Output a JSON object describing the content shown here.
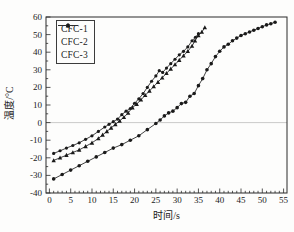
{
  "figure": {
    "background": "#fdfdfc",
    "frame_color": "#2b2b2b",
    "text_color": "#1a1a1a",
    "zero_line_color": "#bdbdbd"
  },
  "chart_data": {
    "type": "line",
    "title": "",
    "xlabel": "时间/s",
    "ylabel": "温度/°C",
    "xlim": [
      0,
      55
    ],
    "ylim": [
      -40,
      60
    ],
    "x_ticks": [
      0,
      5,
      10,
      15,
      20,
      25,
      30,
      35,
      40,
      45,
      50,
      55
    ],
    "y_ticks": [
      -40,
      -30,
      -20,
      -10,
      0,
      10,
      20,
      30,
      40,
      50,
      60
    ],
    "grid": "horizontal reference line at y=0 only",
    "legend_position": "top-left",
    "legend": [
      "CFC-1",
      "CFC-2",
      "CFC-3"
    ],
    "series": [
      {
        "name": "CFC-1",
        "marker": "filled-circle",
        "color": "#2e2e2e",
        "points": [
          [
            1,
            -32
          ],
          [
            3,
            -29.5
          ],
          [
            5,
            -27
          ],
          [
            7,
            -24.5
          ],
          [
            9,
            -22
          ],
          [
            11,
            -19.5
          ],
          [
            13,
            -17
          ],
          [
            15,
            -14.5
          ],
          [
            17,
            -12.5
          ],
          [
            19,
            -10
          ],
          [
            21,
            -7.5
          ],
          [
            23,
            -4
          ],
          [
            25,
            -0.5
          ],
          [
            26,
            1.5
          ],
          [
            27,
            3.8
          ],
          [
            28,
            5.5
          ],
          [
            29,
            6.5
          ],
          [
            30,
            8.5
          ],
          [
            31,
            10.8
          ],
          [
            32,
            11.5
          ],
          [
            33,
            15
          ],
          [
            34,
            16.5
          ],
          [
            35,
            21
          ],
          [
            36,
            25
          ],
          [
            37,
            30
          ],
          [
            38,
            33.5
          ],
          [
            39,
            37.5
          ],
          [
            40,
            40.5
          ],
          [
            41,
            43
          ],
          [
            42,
            44.5
          ],
          [
            43,
            46.5
          ],
          [
            44,
            48
          ],
          [
            45,
            49.5
          ],
          [
            46,
            50.5
          ],
          [
            47,
            51.5
          ],
          [
            48,
            52.5
          ],
          [
            49,
            53.5
          ],
          [
            50,
            54.5
          ],
          [
            51,
            55.5
          ],
          [
            52,
            56.2
          ],
          [
            53,
            57
          ]
        ]
      },
      {
        "name": "CFC-2",
        "marker": "filled-circle-small",
        "color": "#2e2e2e",
        "points": [
          [
            1,
            -17.5
          ],
          [
            2.5,
            -16
          ],
          [
            4,
            -14.5
          ],
          [
            5.5,
            -13
          ],
          [
            7,
            -11.5
          ],
          [
            8.5,
            -9.5
          ],
          [
            10,
            -7.5
          ],
          [
            11.5,
            -5
          ],
          [
            13,
            -2.5
          ],
          [
            14,
            -1
          ],
          [
            15,
            0.5
          ],
          [
            16,
            2
          ],
          [
            17,
            4.5
          ],
          [
            18,
            6.5
          ],
          [
            19,
            8
          ],
          [
            20,
            11
          ],
          [
            21,
            13.5
          ],
          [
            22,
            16.5
          ],
          [
            23,
            20
          ],
          [
            24,
            23.5
          ],
          [
            25,
            26.5
          ],
          [
            25.8,
            29.5
          ],
          [
            26.6,
            28.5
          ],
          [
            27.5,
            31
          ],
          [
            28.5,
            33.5
          ],
          [
            29.5,
            36
          ],
          [
            30.5,
            38.5
          ],
          [
            31.5,
            40.5
          ],
          [
            32.5,
            43
          ],
          [
            33.5,
            46.5
          ],
          [
            34.3,
            48.5
          ],
          [
            35,
            50.5
          ]
        ]
      },
      {
        "name": "CFC-3",
        "marker": "filled-triangle",
        "color": "#2e2e2e",
        "points": [
          [
            1,
            -21.5
          ],
          [
            2.5,
            -20
          ],
          [
            4,
            -18.5
          ],
          [
            5.5,
            -17
          ],
          [
            7,
            -15.5
          ],
          [
            8.5,
            -13.5
          ],
          [
            10,
            -11.5
          ],
          [
            11.5,
            -9
          ],
          [
            12.5,
            -7
          ],
          [
            13.5,
            -5
          ],
          [
            14.5,
            -3
          ],
          [
            15.5,
            -1
          ],
          [
            16.5,
            1
          ],
          [
            17.5,
            3
          ],
          [
            18.5,
            5.5
          ],
          [
            19.5,
            8.5
          ],
          [
            20.5,
            10.5
          ],
          [
            21.5,
            13
          ],
          [
            22.5,
            15.5
          ],
          [
            23.5,
            18
          ],
          [
            24.5,
            20.5
          ],
          [
            25.5,
            23
          ],
          [
            26.5,
            25.5
          ],
          [
            27.5,
            28
          ],
          [
            28.5,
            30.5
          ],
          [
            29.5,
            33
          ],
          [
            30.5,
            35.5
          ],
          [
            31.5,
            38
          ],
          [
            32.5,
            40.5
          ],
          [
            33.5,
            43.5
          ],
          [
            34.2,
            46.5
          ],
          [
            35,
            49.5
          ],
          [
            35.8,
            51.5
          ],
          [
            36.5,
            54
          ]
        ]
      }
    ]
  }
}
